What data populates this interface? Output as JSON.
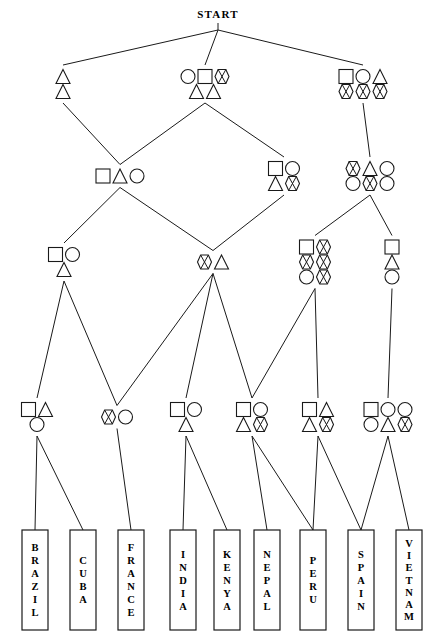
{
  "diagram": {
    "title": "START",
    "title_position": {
      "x": 218,
      "y": 18
    },
    "shape_legend": [
      "square",
      "circle",
      "triangle",
      "bowtie"
    ],
    "stroke_color": "#1a1a1a",
    "fill_color": "#ffffff",
    "background": "#ffffff",
    "nodes": [
      {
        "id": "start",
        "label": "START",
        "x": 218,
        "y": 30,
        "level": 0,
        "shapes": []
      },
      {
        "id": "L1A",
        "x": 63,
        "y": 84,
        "level": 1,
        "rows": [
          [
            "triangle"
          ],
          [
            "triangle"
          ]
        ]
      },
      {
        "id": "L1B",
        "x": 205,
        "y": 84,
        "level": 1,
        "rows": [
          [
            "circle",
            "square",
            "bowtie"
          ],
          [
            "triangle",
            "triangle"
          ]
        ]
      },
      {
        "id": "L1C",
        "x": 363,
        "y": 84,
        "level": 1,
        "rows": [
          [
            "square",
            "circle",
            "triangle"
          ],
          [
            "bowtie",
            "bowtie",
            "bowtie"
          ]
        ]
      },
      {
        "id": "L2A",
        "x": 120,
        "y": 176,
        "level": 2,
        "rows": [
          [
            "square",
            "triangle",
            "circle"
          ]
        ]
      },
      {
        "id": "L2B",
        "x": 284,
        "y": 176,
        "level": 2,
        "rows": [
          [
            "square",
            "circle"
          ],
          [
            "triangle",
            "bowtie"
          ]
        ]
      },
      {
        "id": "L2C",
        "x": 370,
        "y": 176,
        "level": 2,
        "rows": [
          [
            "bowtie",
            "triangle",
            "circle"
          ],
          [
            "circle",
            "bowtie",
            "circle"
          ]
        ]
      },
      {
        "id": "L3A",
        "x": 64,
        "y": 262,
        "level": 3,
        "rows": [
          [
            "square",
            "circle"
          ],
          [
            "triangle"
          ]
        ]
      },
      {
        "id": "L3B",
        "x": 213,
        "y": 262,
        "level": 3,
        "rows": [
          [
            "bowtie",
            "triangle"
          ]
        ]
      },
      {
        "id": "L3C",
        "x": 315,
        "y": 262,
        "level": 3,
        "rows": [
          [
            "square",
            "bowtie"
          ],
          [
            "bowtie",
            "bowtie"
          ],
          [
            "circle",
            "bowtie"
          ]
        ]
      },
      {
        "id": "L3D",
        "x": 392,
        "y": 262,
        "level": 3,
        "rows": [
          [
            "square"
          ],
          [
            "triangle"
          ],
          [
            "circle"
          ]
        ]
      },
      {
        "id": "L4A",
        "x": 37,
        "y": 417,
        "level": 4,
        "rows": [
          [
            "square",
            "triangle"
          ],
          [
            "circle"
          ]
        ]
      },
      {
        "id": "L4B",
        "x": 117,
        "y": 417,
        "level": 4,
        "rows": [
          [
            "bowtie",
            "circle"
          ]
        ]
      },
      {
        "id": "L4C",
        "x": 186,
        "y": 417,
        "level": 4,
        "rows": [
          [
            "square",
            "circle"
          ],
          [
            "triangle"
          ]
        ]
      },
      {
        "id": "L4D",
        "x": 252,
        "y": 417,
        "level": 4,
        "rows": [
          [
            "square",
            "circle"
          ],
          [
            "triangle",
            "bowtie"
          ]
        ]
      },
      {
        "id": "L4E",
        "x": 318,
        "y": 417,
        "level": 4,
        "rows": [
          [
            "square",
            "triangle"
          ],
          [
            "triangle",
            "bowtie"
          ]
        ]
      },
      {
        "id": "L4F",
        "x": 388,
        "y": 417,
        "level": 4,
        "rows": [
          [
            "square",
            "circle",
            "circle"
          ],
          [
            "circle",
            "triangle",
            "bowtie"
          ]
        ]
      }
    ],
    "leaves": [
      {
        "id": "brazil",
        "label": "BRAZIL",
        "x": 22,
        "y": 530,
        "w": 26,
        "h": 100
      },
      {
        "id": "cuba",
        "label": "CUBA",
        "x": 70,
        "y": 530,
        "w": 26,
        "h": 100
      },
      {
        "id": "france",
        "label": "FRANCE",
        "x": 118,
        "y": 530,
        "w": 26,
        "h": 100
      },
      {
        "id": "india",
        "label": "INDIA",
        "x": 170,
        "y": 530,
        "w": 26,
        "h": 100
      },
      {
        "id": "kenya",
        "label": "KENYA",
        "x": 214,
        "y": 530,
        "w": 26,
        "h": 100
      },
      {
        "id": "nepal",
        "label": "NEPAL",
        "x": 254,
        "y": 530,
        "w": 26,
        "h": 100
      },
      {
        "id": "peru",
        "label": "PERU",
        "x": 300,
        "y": 530,
        "w": 26,
        "h": 100
      },
      {
        "id": "spain",
        "label": "SPAIN",
        "x": 348,
        "y": 530,
        "w": 26,
        "h": 100
      },
      {
        "id": "vietnam",
        "label": "VIETNAM",
        "x": 396,
        "y": 530,
        "w": 26,
        "h": 100
      }
    ],
    "edges": [
      {
        "from": "start",
        "to": "L1A"
      },
      {
        "from": "start",
        "to": "L1B"
      },
      {
        "from": "start",
        "to": "L1C"
      },
      {
        "from": "L1A",
        "to": "L2A"
      },
      {
        "from": "L1B",
        "to": "L2A"
      },
      {
        "from": "L1B",
        "to": "L2B"
      },
      {
        "from": "L1C",
        "to": "L2C"
      },
      {
        "from": "L2A",
        "to": "L3A"
      },
      {
        "from": "L2A",
        "to": "L3B"
      },
      {
        "from": "L2B",
        "to": "L3B"
      },
      {
        "from": "L2C",
        "to": "L3C"
      },
      {
        "from": "L2C",
        "to": "L3D"
      },
      {
        "from": "L3A",
        "to": "L4A"
      },
      {
        "from": "L3A",
        "to": "L4B"
      },
      {
        "from": "L3B",
        "to": "L4B"
      },
      {
        "from": "L3B",
        "to": "L4C"
      },
      {
        "from": "L3B",
        "to": "L4D"
      },
      {
        "from": "L3C",
        "to": "L4D"
      },
      {
        "from": "L3C",
        "to": "L4E"
      },
      {
        "from": "L3D",
        "to": "L4F"
      },
      {
        "from": "L4A",
        "to": "brazil"
      },
      {
        "from": "L4A",
        "to": "cuba"
      },
      {
        "from": "L4B",
        "to": "france"
      },
      {
        "from": "L4C",
        "to": "india"
      },
      {
        "from": "L4C",
        "to": "kenya"
      },
      {
        "from": "L4D",
        "to": "nepal"
      },
      {
        "from": "L4D",
        "to": "peru"
      },
      {
        "from": "L4E",
        "to": "peru"
      },
      {
        "from": "L4E",
        "to": "spain"
      },
      {
        "from": "L4F",
        "to": "spain"
      },
      {
        "from": "L4F",
        "to": "vietnam"
      }
    ]
  }
}
